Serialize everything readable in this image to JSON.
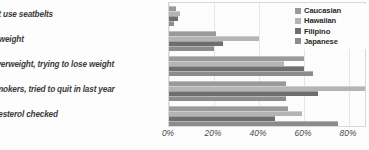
{
  "chart_data": {
    "type": "bar",
    "orientation": "horizontal",
    "title": "",
    "xlabel": "",
    "ylabel": "",
    "xlim": [
      0,
      88
    ],
    "xticks": [
      "0%",
      "20%",
      "40%",
      "60%",
      "80%"
    ],
    "xtick_values": [
      0,
      20,
      40,
      60,
      80
    ],
    "grid": true,
    "legend_position": "top-right",
    "categories": [
      "don't use seatbelts",
      "overweight",
      "of overweight, trying to lose weight",
      "of smokers, tried to quit in last year",
      "cholesterol checked"
    ],
    "series": [
      {
        "name": "Caucasian",
        "color": "#9a9a9a",
        "values": [
          3,
          21,
          60,
          52,
          53
        ]
      },
      {
        "name": "Hawaiian",
        "color": "#b4b4b4",
        "values": [
          5,
          40,
          51,
          88,
          59
        ]
      },
      {
        "name": "Filipino",
        "color": "#6e6e6e",
        "values": [
          4,
          24,
          60,
          66,
          47
        ]
      },
      {
        "name": "Japanese",
        "color": "#8c8c8c",
        "values": [
          2,
          20,
          64,
          52,
          75
        ]
      }
    ]
  },
  "legend": {
    "items": [
      {
        "label": "Caucasian"
      },
      {
        "label": "Hawaiian"
      },
      {
        "label": "Filipino"
      },
      {
        "label": "Japanese"
      }
    ]
  }
}
